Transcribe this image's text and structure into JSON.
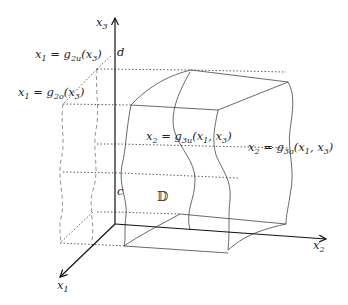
{
  "diagram": {
    "axes": {
      "x1": {
        "name": "x",
        "sub": "1"
      },
      "x2": {
        "name": "x",
        "sub": "2"
      },
      "x3": {
        "name": "x",
        "sub": "3"
      }
    },
    "bounds": {
      "c": "c",
      "d": "d"
    },
    "region": "𝔻",
    "surfaces": {
      "g2u": {
        "lhs": "x",
        "lhs_sub": "1",
        "fn": "g",
        "fn_sub": "2u",
        "args": "(x",
        "arg_sub": "3",
        "close": ")"
      },
      "g2o": {
        "lhs": "x",
        "lhs_sub": "1",
        "fn": "g",
        "fn_sub": "2o",
        "args": "(x",
        "arg_sub": "3",
        "close": ")"
      },
      "g3u": {
        "lhs": "x",
        "lhs_sub": "2",
        "fn": "g",
        "fn_sub": "3u",
        "args1": "(x",
        "arg1_sub": "1",
        "args2": ", x",
        "arg2_sub": "3",
        "close": ")"
      },
      "g3o": {
        "lhs": "x",
        "lhs_sub": "2",
        "fn": "g",
        "fn_sub": "3o",
        "args1": "(x",
        "arg1_sub": "1",
        "args2": ", x",
        "arg2_sub": "3",
        "close": ")"
      }
    }
  }
}
